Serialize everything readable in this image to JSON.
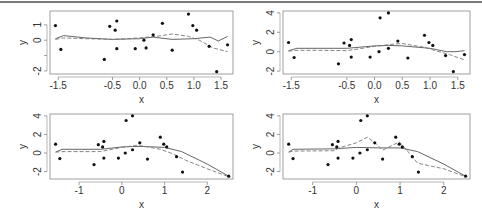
{
  "figure": {
    "colors": {
      "points": "#111111",
      "solid_line": "#555555",
      "dashed_line": "#777777",
      "frame": "#888888",
      "text": "#333333"
    }
  },
  "chart_data": [
    {
      "type": "scatter",
      "panel": "top-left",
      "title": "",
      "xlabel": "x",
      "ylabel": "y",
      "xlim": [
        -1.65,
        1.72
      ],
      "ylim": [
        -2.2,
        1.9
      ],
      "xticks": [
        -1.5,
        -0.5,
        0.0,
        0.5,
        1.0,
        1.5
      ],
      "xtick_labels": [
        "-1.5",
        "-0.5",
        "0.0",
        "0.5",
        "1.0",
        "1.5"
      ],
      "yticks": [
        -2,
        -1,
        0,
        1
      ],
      "ytick_labels": [
        "-2",
        "",
        "0",
        "1"
      ],
      "box": [
        50,
        11,
        233,
        74
      ],
      "points": [
        [
          -1.55,
          0.95
        ],
        [
          -1.45,
          -0.6
        ],
        [
          -0.65,
          -1.25
        ],
        [
          -0.55,
          0.9
        ],
        [
          -0.45,
          0.65
        ],
        [
          -0.42,
          1.25
        ],
        [
          -0.42,
          -0.55
        ],
        [
          -0.08,
          -0.55
        ],
        [
          0.08,
          0.0
        ],
        [
          0.12,
          -0.5
        ],
        [
          0.25,
          0.35
        ],
        [
          0.42,
          1.1
        ],
        [
          0.6,
          -0.65
        ],
        [
          0.9,
          1.7
        ],
        [
          0.98,
          0.95
        ],
        [
          1.05,
          0.65
        ],
        [
          1.28,
          -0.4
        ],
        [
          1.42,
          -2.05
        ],
        [
          1.62,
          -0.3
        ],
        [
          0.1,
          3.5
        ],
        [
          0.25,
          4.0
        ]
      ],
      "series": [
        {
          "name": "solid smoother",
          "style": "solid",
          "values": [
            [
              -1.55,
              0.1
            ],
            [
              -1.4,
              0.3
            ],
            [
              -1.0,
              0.15
            ],
            [
              -0.5,
              0.05
            ],
            [
              0.0,
              0.1
            ],
            [
              0.25,
              0.2
            ],
            [
              0.6,
              0.05
            ],
            [
              1.0,
              0.1
            ],
            [
              1.3,
              0.2
            ],
            [
              1.45,
              -0.05
            ],
            [
              1.62,
              0.25
            ]
          ]
        },
        {
          "name": "dashed smoother",
          "style": "dashed",
          "values": [
            [
              -1.55,
              0.05
            ],
            [
              -1.4,
              0.15
            ],
            [
              -1.0,
              0.1
            ],
            [
              -0.5,
              0.05
            ],
            [
              0.0,
              0.15
            ],
            [
              0.3,
              0.25
            ],
            [
              0.6,
              0.4
            ],
            [
              0.9,
              0.25
            ],
            [
              1.1,
              0.0
            ],
            [
              1.35,
              -0.5
            ],
            [
              1.62,
              -0.75
            ]
          ]
        }
      ]
    },
    {
      "type": "scatter",
      "panel": "top-right",
      "title": "",
      "xlabel": "x",
      "ylabel": "y",
      "xlim": [
        -1.65,
        1.72
      ],
      "ylim": [
        -2.3,
        4.2
      ],
      "xticks": [
        -1.5,
        -0.5,
        0.0,
        0.5,
        1.0,
        1.5
      ],
      "xtick_labels": [
        "-1.5",
        "-0.5",
        "0.0",
        "0.5",
        "1.0",
        "1.5"
      ],
      "yticks": [
        -2,
        0,
        2,
        4
      ],
      "ytick_labels": [
        "-2",
        "0",
        "2",
        "4"
      ],
      "box": [
        283,
        11,
        470,
        74
      ],
      "points": [
        [
          -1.55,
          0.95
        ],
        [
          -1.45,
          -0.6
        ],
        [
          -0.65,
          -1.25
        ],
        [
          -0.55,
          0.9
        ],
        [
          -0.45,
          0.65
        ],
        [
          -0.42,
          1.25
        ],
        [
          -0.42,
          -0.55
        ],
        [
          -0.08,
          -0.55
        ],
        [
          0.08,
          0.0
        ],
        [
          0.1,
          3.5
        ],
        [
          0.25,
          4.0
        ],
        [
          0.25,
          0.35
        ],
        [
          0.42,
          1.1
        ],
        [
          0.6,
          -0.65
        ],
        [
          0.9,
          1.7
        ],
        [
          0.98,
          0.95
        ],
        [
          1.05,
          0.65
        ],
        [
          1.28,
          -0.4
        ],
        [
          1.42,
          -2.05
        ],
        [
          1.62,
          -0.3
        ]
      ],
      "series": [
        {
          "name": "solid smoother",
          "style": "solid",
          "values": [
            [
              -1.55,
              0.1
            ],
            [
              -1.4,
              0.35
            ],
            [
              -1.0,
              0.35
            ],
            [
              -0.5,
              0.35
            ],
            [
              0.0,
              0.6
            ],
            [
              0.25,
              0.65
            ],
            [
              0.5,
              0.6
            ],
            [
              1.0,
              0.35
            ],
            [
              1.3,
              0.0
            ],
            [
              1.45,
              0.0
            ],
            [
              1.62,
              0.1
            ]
          ]
        },
        {
          "name": "dashed smoother",
          "style": "dashed",
          "values": [
            [
              -1.55,
              0.05
            ],
            [
              -1.4,
              0.15
            ],
            [
              -1.0,
              0.15
            ],
            [
              -0.5,
              0.1
            ],
            [
              0.0,
              0.55
            ],
            [
              0.3,
              0.75
            ],
            [
              0.5,
              0.85
            ],
            [
              0.9,
              0.45
            ],
            [
              1.1,
              0.1
            ],
            [
              1.35,
              -0.3
            ],
            [
              1.62,
              -0.85
            ]
          ]
        }
      ]
    },
    {
      "type": "scatter",
      "panel": "bottom-left",
      "title": "",
      "xlabel": "x",
      "ylabel": "y",
      "xlim": [
        -1.68,
        2.6
      ],
      "ylim": [
        -2.8,
        4.2
      ],
      "xticks": [
        -1,
        0,
        1,
        2
      ],
      "xtick_labels": [
        "-1",
        "0",
        "1",
        "2"
      ],
      "yticks": [
        -2,
        0,
        2,
        4
      ],
      "ytick_labels": [
        "-2",
        "0",
        "2",
        "4"
      ],
      "box": [
        50,
        114,
        233,
        179
      ],
      "points": [
        [
          -1.55,
          0.95
        ],
        [
          -1.45,
          -0.6
        ],
        [
          -0.65,
          -1.25
        ],
        [
          -0.55,
          0.9
        ],
        [
          -0.45,
          0.65
        ],
        [
          -0.42,
          1.25
        ],
        [
          -0.42,
          -0.55
        ],
        [
          -0.08,
          -0.55
        ],
        [
          0.08,
          0.0
        ],
        [
          0.1,
          3.5
        ],
        [
          0.25,
          4.0
        ],
        [
          0.25,
          0.35
        ],
        [
          0.42,
          1.1
        ],
        [
          0.6,
          -0.65
        ],
        [
          0.9,
          1.7
        ],
        [
          0.98,
          0.95
        ],
        [
          1.05,
          0.65
        ],
        [
          1.28,
          -0.4
        ],
        [
          1.42,
          -2.05
        ],
        [
          2.5,
          -2.5
        ]
      ],
      "series": [
        {
          "name": "solid smoother",
          "style": "solid",
          "values": [
            [
              -1.55,
              0.1
            ],
            [
              -1.4,
              0.4
            ],
            [
              -1.0,
              0.4
            ],
            [
              -0.5,
              0.4
            ],
            [
              0.0,
              0.65
            ],
            [
              0.25,
              0.7
            ],
            [
              0.5,
              0.7
            ],
            [
              1.0,
              0.6
            ],
            [
              1.4,
              0.15
            ],
            [
              2.0,
              -1.2
            ],
            [
              2.5,
              -2.5
            ]
          ]
        },
        {
          "name": "dashed smoother",
          "style": "dashed",
          "values": [
            [
              -1.55,
              0.1
            ],
            [
              -1.4,
              0.15
            ],
            [
              -1.0,
              0.15
            ],
            [
              -0.5,
              0.15
            ],
            [
              0.0,
              0.6
            ],
            [
              0.3,
              0.8
            ],
            [
              0.5,
              0.75
            ],
            [
              0.9,
              0.4
            ],
            [
              1.2,
              -0.1
            ],
            [
              1.5,
              -0.8
            ],
            [
              2.0,
              -1.7
            ],
            [
              2.5,
              -2.55
            ]
          ]
        }
      ]
    },
    {
      "type": "scatter",
      "panel": "bottom-right",
      "title": "",
      "xlabel": "x",
      "ylabel": "y",
      "xlim": [
        -1.68,
        2.6
      ],
      "ylim": [
        -2.8,
        4.2
      ],
      "xticks": [
        -1,
        0,
        1,
        2
      ],
      "xtick_labels": [
        "-1",
        "0",
        "1",
        "2"
      ],
      "yticks": [
        -2,
        0,
        2,
        4
      ],
      "ytick_labels": [
        "-2",
        "0",
        "2",
        "4"
      ],
      "box": [
        283,
        114,
        470,
        179
      ],
      "points": [
        [
          -1.55,
          0.95
        ],
        [
          -1.45,
          -0.6
        ],
        [
          -0.65,
          -1.25
        ],
        [
          -0.55,
          0.9
        ],
        [
          -0.45,
          0.65
        ],
        [
          -0.42,
          1.25
        ],
        [
          -0.42,
          -0.55
        ],
        [
          -0.08,
          -0.55
        ],
        [
          0.08,
          0.0
        ],
        [
          0.1,
          3.5
        ],
        [
          0.25,
          4.0
        ],
        [
          0.25,
          0.35
        ],
        [
          0.42,
          1.1
        ],
        [
          0.6,
          -0.65
        ],
        [
          0.9,
          1.7
        ],
        [
          0.98,
          0.95
        ],
        [
          1.05,
          0.65
        ],
        [
          1.28,
          -0.4
        ],
        [
          1.42,
          -2.05
        ],
        [
          2.5,
          -2.5
        ]
      ],
      "series": [
        {
          "name": "solid smoother",
          "style": "solid",
          "values": [
            [
              -1.55,
              0.1
            ],
            [
              -1.45,
              0.4
            ],
            [
              -0.5,
              0.45
            ],
            [
              0.0,
              0.6
            ],
            [
              0.5,
              0.55
            ],
            [
              1.0,
              0.55
            ],
            [
              1.4,
              0.15
            ],
            [
              2.0,
              -1.2
            ],
            [
              2.5,
              -2.5
            ]
          ]
        },
        {
          "name": "dashed smoother",
          "style": "dashed",
          "values": [
            [
              -1.55,
              0.1
            ],
            [
              -1.45,
              0.2
            ],
            [
              -0.5,
              0.25
            ],
            [
              -0.4,
              0.55
            ],
            [
              0.0,
              1.1
            ],
            [
              0.25,
              1.7
            ],
            [
              0.45,
              1.0
            ],
            [
              0.6,
              0.3
            ],
            [
              0.98,
              1.2
            ],
            [
              1.1,
              0.6
            ],
            [
              1.4,
              -1.1
            ],
            [
              2.0,
              -1.7
            ],
            [
              2.5,
              -2.55
            ]
          ]
        }
      ]
    }
  ]
}
